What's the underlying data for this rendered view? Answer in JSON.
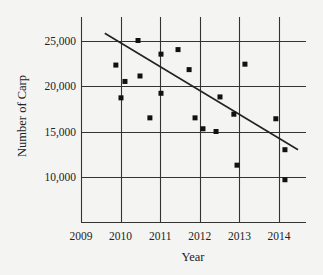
{
  "chart_data": {
    "type": "scatter",
    "title": "",
    "xlabel": "Year",
    "ylabel": "Number of Carp",
    "xlim": [
      2009,
      2014.65
    ],
    "ylim": [
      5000,
      27500
    ],
    "x_ticks": [
      2009,
      2010,
      2011,
      2012,
      2013,
      2014
    ],
    "x_tick_labels": [
      "2009",
      "2010",
      "2011",
      "2012",
      "2013",
      "2014"
    ],
    "y_ticks": [
      10000,
      15000,
      20000,
      25000
    ],
    "y_tick_labels": [
      "10,000",
      "15,000",
      "20,000",
      "25,000"
    ],
    "grid": true,
    "legend": null,
    "series": [
      {
        "name": "Carp count",
        "marker": "square",
        "color": "#111111",
        "points": [
          {
            "x": 2009.88,
            "y": 22300
          },
          {
            "x": 2010.01,
            "y": 18700
          },
          {
            "x": 2010.11,
            "y": 20500
          },
          {
            "x": 2010.44,
            "y": 25000
          },
          {
            "x": 2010.49,
            "y": 21100
          },
          {
            "x": 2010.74,
            "y": 16500
          },
          {
            "x": 2011.02,
            "y": 23500
          },
          {
            "x": 2011.02,
            "y": 19200
          },
          {
            "x": 2011.45,
            "y": 24000
          },
          {
            "x": 2011.73,
            "y": 21800
          },
          {
            "x": 2011.88,
            "y": 16500
          },
          {
            "x": 2012.08,
            "y": 15300
          },
          {
            "x": 2012.41,
            "y": 15000
          },
          {
            "x": 2012.51,
            "y": 18800
          },
          {
            "x": 2012.86,
            "y": 16900
          },
          {
            "x": 2013.14,
            "y": 22400
          },
          {
            "x": 2012.94,
            "y": 11300
          },
          {
            "x": 2013.92,
            "y": 16400
          },
          {
            "x": 2014.15,
            "y": 13000
          },
          {
            "x": 2014.15,
            "y": 9700
          }
        ]
      }
    ],
    "trend_line": {
      "name": "Line of best fit",
      "color": "#222222",
      "start": {
        "x": 2009.6,
        "y": 25800
      },
      "end": {
        "x": 2014.48,
        "y": 13000
      }
    }
  }
}
